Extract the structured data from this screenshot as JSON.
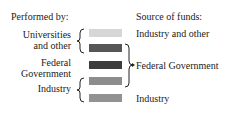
{
  "legend": {
    "performed_by_title": "Performed by:",
    "source_title": "Source of funds:",
    "performers": [
      {
        "label_line1": "Universities",
        "label_line2": "and other"
      },
      {
        "label_line1": "Federal",
        "label_line2": "Government"
      },
      {
        "label_line1": "Industry"
      }
    ],
    "sources": [
      {
        "label": "Industry and other"
      },
      {
        "label": "Federal Government"
      },
      {
        "label": "Industry"
      }
    ],
    "swatches": [
      {
        "color": "#d6d6d6"
      },
      {
        "color": "#565656"
      },
      {
        "color": "#3c3c3c"
      },
      {
        "color": "#8c8c8c"
      },
      {
        "color": "#929292"
      }
    ]
  }
}
